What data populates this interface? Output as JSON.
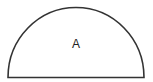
{
  "diagram": {
    "shape": "semicircle",
    "label": "A",
    "stroke_color": "#333333",
    "fill_color": "#ffffff"
  }
}
